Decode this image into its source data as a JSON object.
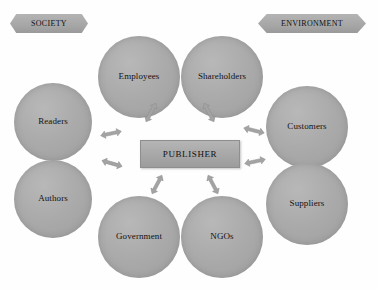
{
  "diagram": {
    "title_center": "PUBLISHER",
    "banners": [
      {
        "id": "society",
        "label": "SOCIETY",
        "x": 10,
        "y": 14,
        "w": 78,
        "h": 19
      },
      {
        "id": "environment",
        "label": "ENVIRONMENT",
        "x": 258,
        "y": 14,
        "w": 108,
        "h": 19
      }
    ],
    "center": {
      "label": "PUBLISHER",
      "x": 140,
      "y": 140,
      "w": 98,
      "h": 26
    },
    "nodes": [
      {
        "id": "employees",
        "label": "Employees",
        "x": 98,
        "y": 36,
        "d": 82
      },
      {
        "id": "shareholders",
        "label": "Shareholders",
        "x": 181,
        "y": 36,
        "d": 82
      },
      {
        "id": "readers",
        "label": "Readers",
        "x": 14,
        "y": 83,
        "d": 78
      },
      {
        "id": "customers",
        "label": "Customers",
        "x": 266,
        "y": 86,
        "d": 82
      },
      {
        "id": "authors",
        "label": "Authors",
        "x": 14,
        "y": 160,
        "d": 78
      },
      {
        "id": "suppliers",
        "label": "Suppliers",
        "x": 266,
        "y": 163,
        "d": 82
      },
      {
        "id": "government",
        "label": "Government",
        "x": 98,
        "y": 196,
        "d": 82
      },
      {
        "id": "ngos",
        "label": "NGOs",
        "x": 181,
        "y": 196,
        "d": 82
      }
    ],
    "connectors": [
      {
        "id": "employees-link",
        "x": 140,
        "y": 108,
        "rot": -62
      },
      {
        "id": "shareholders-link",
        "x": 198,
        "y": 108,
        "rot": -118
      },
      {
        "id": "readers-link",
        "x": 100,
        "y": 129,
        "rot": -12
      },
      {
        "id": "customers-link",
        "x": 243,
        "y": 126,
        "rot": 14
      },
      {
        "id": "authors-link",
        "x": 101,
        "y": 159,
        "rot": 16
      },
      {
        "id": "suppliers-link",
        "x": 244,
        "y": 157,
        "rot": -12
      },
      {
        "id": "government-link",
        "x": 146,
        "y": 180,
        "rot": -62
      },
      {
        "id": "ngos-link",
        "x": 202,
        "y": 180,
        "rot": -118
      }
    ],
    "colors": {
      "node_fill": "#a9a9a9",
      "center_fill": "#a7a7a7",
      "banner_fill": "#a6a6a6",
      "arrow_fill": "#a3a3a3",
      "text": "#111111",
      "background": "#fefefe"
    }
  }
}
